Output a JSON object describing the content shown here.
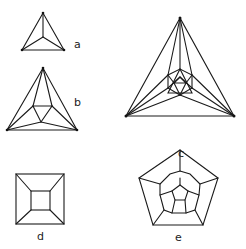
{
  "figures": [
    {
      "id": "a",
      "label": "a",
      "description": "tetrahedron Schlegel diagram"
    },
    {
      "id": "b",
      "label": "b",
      "description": "octahedron Schlegel diagram"
    },
    {
      "id": "c",
      "label": "c",
      "description": "icosahedron Schlegel diagram"
    },
    {
      "id": "d",
      "label": "d",
      "description": "cube Schlegel diagram"
    },
    {
      "id": "e",
      "label": "e",
      "description": "dodecahedron Schlegel diagram"
    }
  ],
  "colors": {
    "line": "#1a1a1a",
    "background": "#ffffff"
  }
}
